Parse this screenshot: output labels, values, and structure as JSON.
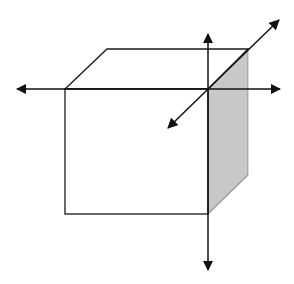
{
  "diagram": {
    "title": "",
    "colors": {
      "background": "#ffffff",
      "line": "#1a1a1a",
      "side_face_fill": "#c8c8c8"
    },
    "cube": {
      "front_face": {
        "x1": 65,
        "y1": 89,
        "x2": 208,
        "y2": 214
      },
      "top_face_points": "65,89 107,49 248,49 208,89",
      "side_face_points": "208,89 248,49 248,175 208,214"
    },
    "axes": [
      {
        "name": "horizontal-axis",
        "from": [
          17,
          89
        ],
        "to": [
          280,
          89
        ],
        "arrows": "both"
      },
      {
        "name": "vertical-axis",
        "from": [
          208,
          34
        ],
        "to": [
          208,
          270
        ],
        "arrows": "both"
      },
      {
        "name": "depth-axis",
        "from": [
          168,
          128
        ],
        "to": [
          279,
          20
        ],
        "arrows": "both"
      }
    ],
    "origin": [
      208,
      89
    ],
    "labels": []
  }
}
